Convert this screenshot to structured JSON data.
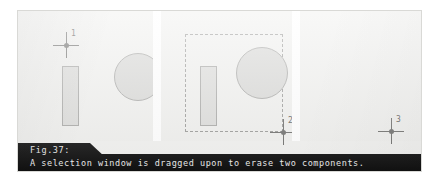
{
  "figure": {
    "number_label": "Fig.37:",
    "caption": "A selection window is dragged upon to erase two components.",
    "alt_summary": "Three-step CAD sequence showing a selection window dragged over a rectangle and a circle, which are then erased."
  },
  "colors": {
    "plate_background": "#f2f2f0",
    "panel_background": "#f0f0ee",
    "divider": "#ffffff",
    "shape_fill": "#d8d8d6",
    "shape_stroke": "#a8a8a6",
    "selection_stroke": "#9a9a98",
    "crosshair": "#6e6e6c",
    "caption_bar": "#111111",
    "caption_text": "#ededed"
  },
  "panels": [
    {
      "id": "panel-1",
      "step": "1",
      "cursor_label": "1",
      "has_selection_window": false,
      "shapes": [
        {
          "kind": "rectangle",
          "name": "component-rectangle"
        },
        {
          "kind": "circle",
          "name": "component-circle"
        }
      ]
    },
    {
      "id": "panel-2",
      "step": "2",
      "cursor_label": "2",
      "has_selection_window": true,
      "shapes": [
        {
          "kind": "rectangle",
          "name": "component-rectangle"
        },
        {
          "kind": "circle",
          "name": "component-circle"
        },
        {
          "kind": "selection-window",
          "name": "selection-window"
        }
      ]
    },
    {
      "id": "panel-3",
      "step": "3",
      "cursor_label": "3",
      "has_selection_window": false,
      "shapes": []
    }
  ]
}
